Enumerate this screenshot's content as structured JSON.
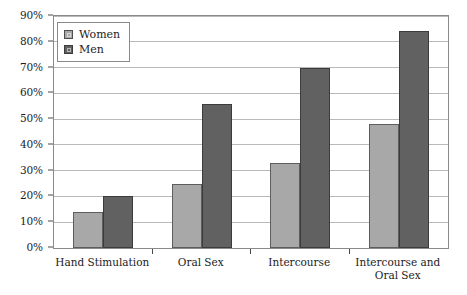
{
  "chart_data": {
    "type": "bar",
    "title": "",
    "subtitle": "",
    "xlabel": "",
    "ylabel": "",
    "ylim": [
      0,
      90
    ],
    "grid": true,
    "legend_position": "top-left",
    "categories": [
      "Hand Stimulation",
      "Oral Sex",
      "Intercourse",
      "Intercourse and Oral Sex"
    ],
    "category_lines": [
      [
        "Hand Stimulation"
      ],
      [
        "Oral Sex"
      ],
      [
        "Intercourse"
      ],
      [
        "Intercourse and",
        "Oral Sex"
      ]
    ],
    "series": [
      {
        "name": "Women",
        "color": "#a8a8a8",
        "values": [
          14,
          25,
          33,
          48
        ]
      },
      {
        "name": "Men",
        "color": "#616161",
        "values": [
          20,
          56,
          70,
          84
        ]
      }
    ],
    "y_ticks": [
      {
        "value": 0,
        "label": "0%"
      },
      {
        "value": 10,
        "label": "10%"
      },
      {
        "value": 20,
        "label": "20%"
      },
      {
        "value": 30,
        "label": "30%"
      },
      {
        "value": 40,
        "label": "40%"
      },
      {
        "value": 50,
        "label": "50%"
      },
      {
        "value": 60,
        "label": "60%"
      },
      {
        "value": 70,
        "label": "70%"
      },
      {
        "value": 80,
        "label": "80%"
      },
      {
        "value": 90,
        "label": "90%"
      }
    ]
  },
  "legend": {
    "items": [
      {
        "label": "Women",
        "swatch": "women-swatch-icon"
      },
      {
        "label": "Men",
        "swatch": "men-swatch-icon"
      }
    ]
  }
}
